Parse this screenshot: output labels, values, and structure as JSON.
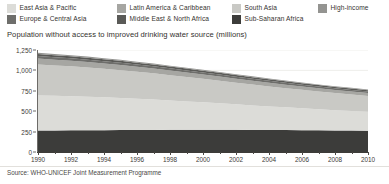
{
  "legend": {
    "items": [
      {
        "label": "East Asia & Pacific",
        "color": "#dcdcd8",
        "col": 0,
        "row": 0
      },
      {
        "label": "Europe & Central Asia",
        "color": "#6e6e6b",
        "col": 0,
        "row": 1
      },
      {
        "label": "Latin America & Caribbean",
        "color": "#a6a6a2",
        "col": 1,
        "row": 0
      },
      {
        "label": "Middle East & North Africa",
        "color": "#5a5a57",
        "col": 1,
        "row": 1
      },
      {
        "label": "South Asia",
        "color": "#c9c9c5",
        "col": 2,
        "row": 0
      },
      {
        "label": "Sub-Saharan Africa",
        "color": "#3c3c3a",
        "col": 2,
        "row": 1
      },
      {
        "label": "High-income",
        "color": "#949491",
        "col": 3,
        "row": 0
      }
    ]
  },
  "chart_data": {
    "type": "area",
    "stacked": true,
    "title": "Population without access to improved drinking water source (millions)",
    "xlabel": "",
    "ylabel": "",
    "ylim": [
      0,
      1250
    ],
    "xlim": [
      1990,
      2010
    ],
    "grid": true,
    "legend_position": "top",
    "yticks": [
      "0",
      "250",
      "500",
      "750",
      "1,000",
      "1,250"
    ],
    "ytick_values": [
      0,
      250,
      500,
      750,
      1000,
      1250
    ],
    "xticks": [
      "1990",
      "1992",
      "1994",
      "1996",
      "1998",
      "2000",
      "2002",
      "2004",
      "2006",
      "2008",
      "2010"
    ],
    "x": [
      1990,
      1991,
      1992,
      1993,
      1994,
      1995,
      1996,
      1997,
      1998,
      1999,
      2000,
      2001,
      2002,
      2003,
      2004,
      2005,
      2006,
      2007,
      2008,
      2009,
      2010
    ],
    "series": [
      {
        "name": "Sub-Saharan Africa",
        "color": "#3c3c3a",
        "values": [
          263,
          264,
          266,
          267,
          268,
          269,
          270,
          271,
          272,
          272,
          273,
          273,
          272,
          271,
          270,
          269,
          268,
          266,
          264,
          262,
          260
        ]
      },
      {
        "name": "East Asia & Pacific",
        "color": "#dcdcd8",
        "values": [
          430,
          424,
          418,
          410,
          402,
          393,
          383,
          372,
          360,
          348,
          336,
          324,
          312,
          300,
          289,
          278,
          268,
          258,
          249,
          241,
          233
        ]
      },
      {
        "name": "South Asia",
        "color": "#c9c9c5",
        "values": [
          380,
          373,
          366,
          358,
          350,
          341,
          331,
          321,
          310,
          299,
          288,
          277,
          266,
          255,
          245,
          235,
          226,
          217,
          209,
          201,
          194
        ]
      },
      {
        "name": "Latin America & Caribbean",
        "color": "#a6a6a2",
        "values": [
          72,
          70,
          69,
          67,
          65,
          63,
          61,
          59,
          57,
          55,
          53,
          51,
          49,
          47,
          45,
          43,
          41,
          39,
          38,
          36,
          35
        ]
      },
      {
        "name": "Europe & Central Asia",
        "color": "#6e6e6b",
        "values": [
          30,
          30,
          29,
          29,
          28,
          28,
          27,
          27,
          26,
          26,
          25,
          25,
          24,
          24,
          23,
          23,
          22,
          22,
          21,
          21,
          20
        ]
      },
      {
        "name": "Middle East & North Africa",
        "color": "#5a5a57",
        "values": [
          26,
          26,
          25,
          25,
          24,
          24,
          23,
          23,
          22,
          22,
          21,
          21,
          20,
          20,
          19,
          19,
          18,
          18,
          17,
          17,
          16
        ]
      },
      {
        "name": "High-income",
        "color": "#949491",
        "values": [
          14,
          14,
          13,
          13,
          13,
          12,
          12,
          12,
          11,
          11,
          11,
          10,
          10,
          10,
          9,
          9,
          9,
          8,
          8,
          8,
          7
        ]
      }
    ],
    "totals": [
      1215,
      1201,
      1186,
      1169,
      1150,
      1130,
      1107,
      1085,
      1058,
      1033,
      1007,
      981,
      953,
      927,
      900,
      876,
      852,
      828,
      806,
      786,
      765
    ]
  },
  "source": {
    "text": "Source: WHO-UNICEF Joint Measurement Programme"
  }
}
